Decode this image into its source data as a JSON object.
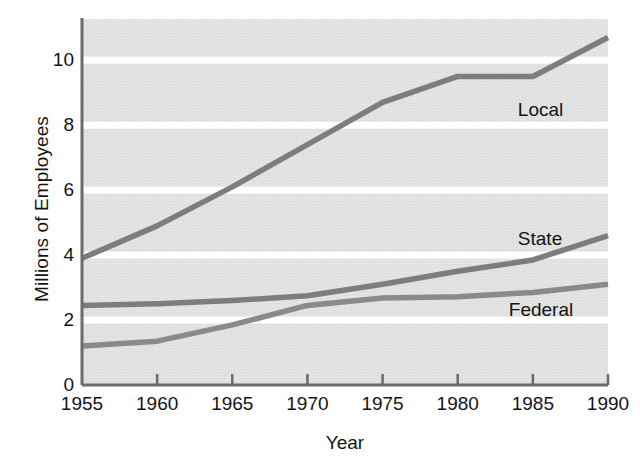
{
  "chart_data": {
    "type": "line",
    "title": "",
    "xlabel": "Year",
    "ylabel": "Millions of Employees",
    "xlim": [
      1955,
      1990
    ],
    "ylim": [
      0,
      11.3
    ],
    "grid": true,
    "grid_orientation": "horizontal",
    "legend_position": "inline-right-of-series",
    "x": [
      1955,
      1960,
      1965,
      1970,
      1975,
      1980,
      1985,
      1990
    ],
    "xticks": [
      "1955",
      "1960",
      "1965",
      "1970",
      "1975",
      "1980",
      "1985",
      "1990"
    ],
    "yticks": [
      "0",
      "2",
      "4",
      "6",
      "8",
      "10"
    ],
    "ytick_values": [
      0,
      2,
      4,
      6,
      8,
      10
    ],
    "series": [
      {
        "name": "Local",
        "label": "Local",
        "color": "#7d7d7d",
        "values": [
          3.9,
          4.9,
          6.1,
          7.4,
          8.7,
          9.5,
          9.5,
          10.7
        ]
      },
      {
        "name": "State",
        "label": "State",
        "color": "#7d7d7d",
        "values": [
          2.45,
          2.5,
          2.6,
          2.75,
          3.1,
          3.5,
          3.85,
          4.6
        ]
      },
      {
        "name": "Federal",
        "label": "Federal",
        "color": "#8a8a8a",
        "values": [
          1.2,
          1.35,
          1.85,
          2.45,
          2.68,
          2.72,
          2.85,
          3.1
        ]
      }
    ],
    "annotations": [
      {
        "text": "Local",
        "x": 1984.0,
        "y": 8.45
      },
      {
        "text": "State",
        "x": 1984.0,
        "y": 4.45
      },
      {
        "text": "Federal",
        "x": 1983.4,
        "y": 2.28
      }
    ],
    "colors": {
      "plot_background": "#e2e2e2",
      "gridline": "#ffffff",
      "axis": "#6b6b6b",
      "text": "#141414",
      "page_background": "#ffffff"
    }
  }
}
